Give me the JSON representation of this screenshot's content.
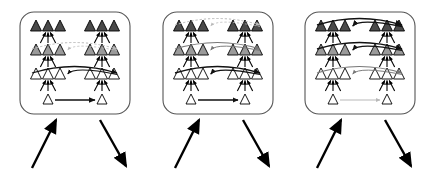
{
  "figure": {
    "panel_count": 3,
    "canvas": {
      "width": 429,
      "height": 174,
      "background": "#ffffff"
    },
    "colors": {
      "level4_fill": "#4a4a4a",
      "level3_fill": "#9a9a9a",
      "level2_fill": "#ffffff",
      "level1_fill": "#ffffff",
      "node_stroke": "#000000",
      "panel_border": "#555555",
      "arc_dark": "#111111",
      "arc_mid": "#777777",
      "arc_light": "#b8b8b8",
      "io_arrow": "#000000"
    },
    "levels": [
      {
        "index": 1,
        "name": "level-1",
        "node_count_per_side": 1,
        "fill_key": "level1_fill",
        "y": 104
      },
      {
        "index": 2,
        "name": "level-2",
        "node_count_per_side": 3,
        "fill_key": "level2_fill",
        "y": 79
      },
      {
        "index": 3,
        "name": "level-3",
        "node_count_per_side": 3,
        "fill_key": "level3_fill",
        "y": 55
      },
      {
        "index": 4,
        "name": "level-4",
        "node_count_per_side": 3,
        "fill_key": "level4_fill",
        "y": 31
      }
    ],
    "panels": [
      {
        "id": "panel-1",
        "label": "Stage 1",
        "box": {
          "x": 20,
          "y": 12,
          "width": 110,
          "height": 102,
          "radius": 14
        },
        "lateral_arcs": [
          {
            "level": 1,
            "style": "solid",
            "tone": "arc_dark",
            "width": 1.5
          },
          {
            "level": 2,
            "style": "solid",
            "tone": "arc_dark",
            "width": 1.3
          },
          {
            "level": 3,
            "style": "dashed",
            "tone": "arc_light",
            "width": 1.0
          },
          {
            "level": 4,
            "style": "none",
            "tone": "arc_light",
            "width": 0.8
          }
        ],
        "bottom_arrow_tone": "arc_dark",
        "input_arrow": {
          "from": [
            32,
            168
          ],
          "to": [
            56,
            120
          ],
          "tone": "io_arrow"
        },
        "output_arrow": {
          "from": [
            100,
            120
          ],
          "to": [
            126,
            166
          ],
          "tone": "io_arrow"
        }
      },
      {
        "id": "panel-2",
        "label": "Stage 2",
        "box": {
          "x": 163,
          "y": 12,
          "width": 110,
          "height": 102,
          "radius": 14
        },
        "lateral_arcs": [
          {
            "level": 1,
            "style": "solid",
            "tone": "arc_dark",
            "width": 1.3
          },
          {
            "level": 2,
            "style": "solid",
            "tone": "arc_dark",
            "width": 1.5
          },
          {
            "level": 3,
            "style": "solid",
            "tone": "arc_mid",
            "width": 1.2
          },
          {
            "level": 4,
            "style": "dashed",
            "tone": "arc_light",
            "width": 1.0
          }
        ],
        "bottom_arrow_tone": "arc_mid",
        "input_arrow": {
          "from": [
            175,
            168
          ],
          "to": [
            199,
            120
          ],
          "tone": "io_arrow"
        },
        "output_arrow": {
          "from": [
            243,
            120
          ],
          "to": [
            269,
            166
          ],
          "tone": "io_arrow"
        }
      },
      {
        "id": "panel-3",
        "label": "Stage 3",
        "box": {
          "x": 305,
          "y": 12,
          "width": 110,
          "height": 102,
          "radius": 14
        },
        "lateral_arcs": [
          {
            "level": 1,
            "style": "solid",
            "tone": "arc_light",
            "width": 1.0
          },
          {
            "level": 2,
            "style": "solid",
            "tone": "arc_mid",
            "width": 1.2
          },
          {
            "level": 3,
            "style": "solid",
            "tone": "arc_dark",
            "width": 1.5
          },
          {
            "level": 4,
            "style": "solid",
            "tone": "arc_dark",
            "width": 1.6
          }
        ],
        "bottom_arrow_tone": "arc_light",
        "input_arrow": {
          "from": [
            317,
            168
          ],
          "to": [
            341,
            120
          ],
          "tone": "io_arrow"
        },
        "output_arrow": {
          "from": [
            385,
            120
          ],
          "to": [
            411,
            166
          ],
          "tone": "io_arrow"
        }
      }
    ],
    "geometry": {
      "left_group_center_offset": -27,
      "right_group_center_offset": 27,
      "node_spacing": 12,
      "node_width": 11,
      "node_height": 11,
      "bottom_node_width": 10,
      "bottom_node_height": 10
    }
  }
}
